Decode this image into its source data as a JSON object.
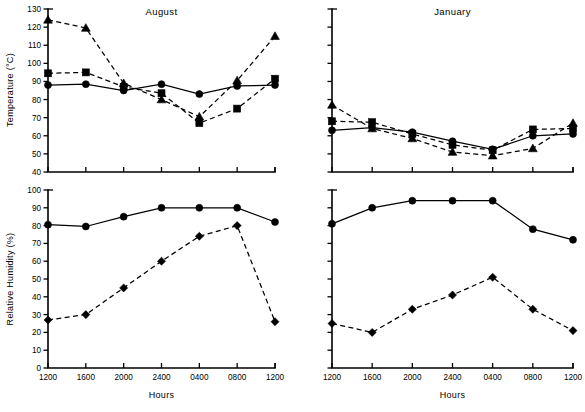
{
  "figure": {
    "xlabel": "Hours",
    "ylabel_top": "Temperature  (°C)",
    "ylabel_bottom": "Relative Humidity  (%)",
    "hours": [
      "1200",
      "1600",
      "2000",
      "2400",
      "0400",
      "0800",
      "1200"
    ]
  },
  "chart_data": [
    {
      "type": "line",
      "title": "August",
      "panel": "august-temperature",
      "xlabel": "Hours",
      "ylabel": "Temperature  (°C)",
      "categories": [
        "1200",
        "1600",
        "2000",
        "2400",
        "0400",
        "0800",
        "1200"
      ],
      "ylim": [
        40,
        130
      ],
      "yticks": [
        40,
        50,
        60,
        70,
        80,
        90,
        100,
        110,
        120,
        130
      ],
      "ytick_labels": [
        "40",
        "50",
        "60",
        "70",
        "80",
        "90",
        "100",
        "110",
        "120",
        "130"
      ],
      "grid": false,
      "legend": "none",
      "series": [
        {
          "name": "circle-solid",
          "marker": "circle",
          "linestyle": "solid",
          "values": [
            88,
            88.5,
            85,
            88.5,
            83,
            87.5,
            88
          ]
        },
        {
          "name": "square-dashed",
          "marker": "square",
          "linestyle": "dashed",
          "values": [
            94.5,
            95,
            87,
            83.5,
            67,
            75,
            91.5
          ]
        },
        {
          "name": "triangle-dashed",
          "marker": "triangle",
          "linestyle": "dashed",
          "values": [
            124,
            119.5,
            89,
            80,
            70.5,
            90.5,
            115
          ]
        }
      ]
    },
    {
      "type": "line",
      "title": "January",
      "panel": "january-temperature",
      "xlabel": "Hours",
      "ylabel": "Temperature  (°C)",
      "categories": [
        "1200",
        "1600",
        "2000",
        "2400",
        "0400",
        "0800",
        "1200"
      ],
      "ylim": [
        40,
        130
      ],
      "yticks": [
        40,
        50,
        60,
        70,
        80,
        90,
        100,
        110,
        120,
        130
      ],
      "ytick_labels": [
        "",
        "",
        "",
        "",
        "",
        "",
        "",
        "",
        "",
        ""
      ],
      "grid": false,
      "legend": "none",
      "series": [
        {
          "name": "circle-solid",
          "marker": "circle",
          "linestyle": "solid",
          "values": [
            63,
            64.5,
            62,
            57,
            52.5,
            60,
            61
          ]
        },
        {
          "name": "square-dashed",
          "marker": "square",
          "linestyle": "dashed",
          "values": [
            68,
            67.5,
            61,
            55,
            52,
            63.5,
            64
          ]
        },
        {
          "name": "triangle-dashed",
          "marker": "triangle",
          "linestyle": "dashed",
          "values": [
            77,
            64,
            58.5,
            51,
            49,
            53,
            67
          ]
        }
      ]
    },
    {
      "type": "line",
      "title": "",
      "panel": "august-relative-humidity",
      "xlabel": "Hours",
      "ylabel": "Relative Humidity  (%)",
      "categories": [
        "1200",
        "1600",
        "2000",
        "2400",
        "0400",
        "0800",
        "1200"
      ],
      "ylim": [
        0,
        100
      ],
      "yticks": [
        0,
        10,
        20,
        30,
        40,
        50,
        60,
        70,
        80,
        90,
        100
      ],
      "ytick_labels": [
        "0",
        "10",
        "20",
        "30",
        "40",
        "50",
        "60",
        "70",
        "80",
        "90",
        "100"
      ],
      "grid": false,
      "legend": "none",
      "series": [
        {
          "name": "circle-solid",
          "marker": "circle",
          "linestyle": "solid",
          "values": [
            80.5,
            79.5,
            85,
            90,
            90,
            90,
            82
          ]
        },
        {
          "name": "diamond-dashed",
          "marker": "diamond",
          "linestyle": "dashed",
          "values": [
            27,
            30,
            45,
            60,
            74,
            80,
            26
          ]
        }
      ]
    },
    {
      "type": "line",
      "title": "",
      "panel": "january-relative-humidity",
      "xlabel": "Hours",
      "ylabel": "Relative Humidity  (%)",
      "categories": [
        "1200",
        "1600",
        "2000",
        "2400",
        "0400",
        "0800",
        "1200"
      ],
      "ylim": [
        0,
        100
      ],
      "yticks": [
        0,
        10,
        20,
        30,
        40,
        50,
        60,
        70,
        80,
        90,
        100
      ],
      "ytick_labels": [
        "",
        "",
        "",
        "",
        "",
        "",
        "",
        "",
        "",
        "",
        ""
      ],
      "grid": false,
      "legend": "none",
      "series": [
        {
          "name": "circle-solid",
          "marker": "circle",
          "linestyle": "solid",
          "values": [
            81,
            90,
            94,
            94,
            94,
            78,
            72
          ]
        },
        {
          "name": "diamond-dashed",
          "marker": "diamond",
          "linestyle": "dashed",
          "values": [
            25,
            20,
            33,
            41,
            51,
            33,
            21
          ]
        }
      ]
    }
  ]
}
